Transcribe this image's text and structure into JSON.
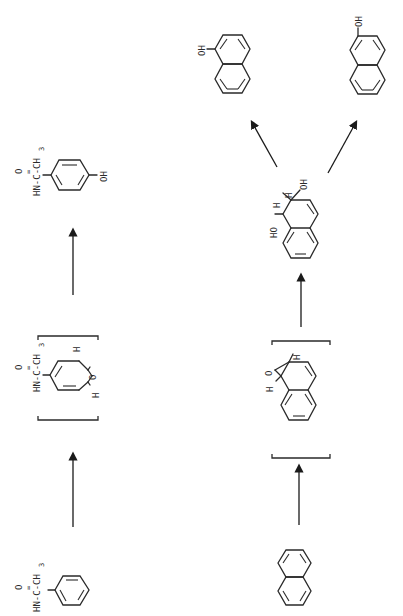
{
  "figure": {
    "orientation": "rotated-90-ccw",
    "background": "#ffffff",
    "ink_color": "#2a2a2a"
  },
  "pathway_1": {
    "name": "acetanilide-hydroxylation",
    "compounds": [
      {
        "id": "acetanilide",
        "substituent_label": "HN-C-CH",
        "subscript": "3",
        "carbonyl_o": "O",
        "double_bond_mark": "∥"
      },
      {
        "id": "arene-oxide-intermediate",
        "substituent_label": "HN-C-CH",
        "subscript": "3",
        "carbonyl_o": "O",
        "epoxide_o": "O",
        "h_labels": [
          "H",
          "H"
        ],
        "bracketed": true
      },
      {
        "id": "p-hydroxyacetanilide",
        "substituent_label": "HN-C-CH",
        "subscript": "3",
        "carbonyl_o": "O",
        "hydroxyl": "OH"
      }
    ],
    "arrows": 2
  },
  "pathway_2": {
    "name": "naphthalene-oxidation",
    "compounds": [
      {
        "id": "naphthalene"
      },
      {
        "id": "naphthalene-1,2-oxide",
        "epoxide_o": "O",
        "h_labels": [
          "H",
          "H"
        ],
        "bracketed": true
      },
      {
        "id": "dihydrodiol",
        "hydroxyls": [
          "HO",
          "OH"
        ],
        "h_labels": [
          "H",
          "H"
        ]
      },
      {
        "id": "1-naphthol",
        "hydroxyl": "OH"
      },
      {
        "id": "2-naphthol",
        "hydroxyl": "OH"
      }
    ],
    "arrows": 4
  },
  "labels": {
    "hn": "HN-C-CH",
    "sub3": "3",
    "o": "O",
    "oh": "OH",
    "ho": "HO",
    "h": "H"
  }
}
